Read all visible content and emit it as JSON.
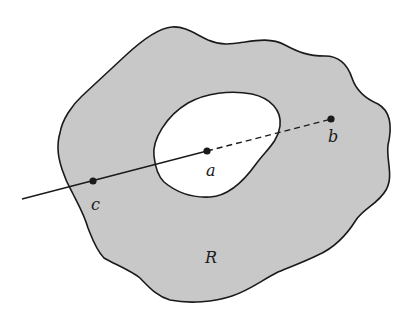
{
  "diagram": {
    "region": {
      "label": "R",
      "fill": "#c8c8c8",
      "stroke": "#1a1a1a"
    },
    "hole": {
      "fill": "#ffffff"
    },
    "points": [
      {
        "id": "a",
        "label": "a"
      },
      {
        "id": "b",
        "label": "b"
      },
      {
        "id": "c",
        "label": "c"
      }
    ],
    "segments": [
      {
        "from": "outside",
        "to": "a",
        "style": "solid"
      },
      {
        "from": "a",
        "to": "b",
        "style": "dashed"
      }
    ]
  }
}
